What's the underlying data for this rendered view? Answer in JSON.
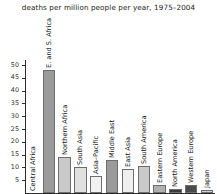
{
  "chart_data": {
    "type": "bar",
    "title": "deaths per million people per year, 1975–2004",
    "xlabel": "",
    "ylabel": "",
    "ylim": [
      0,
      52
    ],
    "grid": false,
    "legend": null,
    "yticks": [
      5,
      10,
      15,
      20,
      25,
      30,
      35,
      40,
      45,
      50
    ],
    "ytick_labels": [
      "5",
      "10",
      "15",
      "20",
      "25",
      "30",
      "35",
      "40",
      "45",
      "50"
    ],
    "categories": [
      "Central Africa",
      "E. and S. Africa",
      "Northern Africa",
      "South Asia",
      "Asia–Pacific",
      "Middle East",
      "East Asia",
      "South America",
      "Eastern Europe",
      "North America",
      "Western Europe",
      "Japan"
    ],
    "values": [
      0.0,
      48.0,
      14.0,
      10.0,
      6.5,
      13.0,
      9.5,
      10.5,
      3.0,
      1.5,
      3.0,
      1.0
    ],
    "bar_colors": [
      "#9a9a9a",
      "#9a9a9a",
      "#c9c9c9",
      "#e0e0e0",
      "#f2f2f2",
      "#9a9a9a",
      "#efefef",
      "#c9c9c9",
      "#b0b0b0",
      "#3b3b3b",
      "#4a4a4a",
      "#d0d0d0"
    ]
  }
}
